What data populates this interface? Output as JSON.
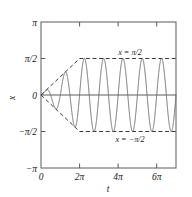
{
  "chart_data": {
    "type": "line",
    "title": "",
    "subtitle": "",
    "xlabel": "t",
    "ylabel": "x",
    "xlim": [
      0,
      21.9911485751
    ],
    "ylim": [
      -3.1415926536,
      3.1415926536
    ],
    "grid": false,
    "legend_position": "none",
    "xticks": [
      0,
      6.2831853072,
      12.5663706144,
      18.8495559215
    ],
    "xticklabels": [
      "0",
      "2π",
      "4π",
      "6π"
    ],
    "yticks": [
      3.1415926536,
      1.5707963268,
      0,
      -1.5707963268,
      -3.1415926536
    ],
    "yticklabels": [
      "π",
      "π/2",
      "0",
      "−π/2",
      "−π"
    ],
    "annotations": [
      {
        "id": "upper-asymptote-label",
        "text": "x = π/2",
        "x": 12.2,
        "y": 1.85
      },
      {
        "id": "lower-asymptote-label",
        "text": "x = −π/2",
        "x": 12.2,
        "y": -2.0
      }
    ],
    "series": [
      {
        "name": "oscillation",
        "style": "solid",
        "color": "#6e6e6e",
        "description": "Amplitude grows linearly from 0 at t=0 to pi/2 at t=2pi then saturates; angular frequency 2 (period pi)",
        "amplitude_saturation": 1.5707963268,
        "ramp_end_t": 6.2831853072,
        "angular_frequency": 2
      },
      {
        "name": "upper-envelope",
        "style": "dashed",
        "color": "#3a3a3a",
        "description": "Line from (0,0) to (2pi, pi/2), then constant at pi/2 to t=7pi",
        "points": [
          [
            0,
            0
          ],
          [
            6.2831853072,
            1.5707963268
          ],
          [
            21.9911485751,
            1.5707963268
          ]
        ]
      },
      {
        "name": "lower-envelope",
        "style": "dashed",
        "color": "#3a3a3a",
        "description": "Line from (0,0) to (2pi, -pi/2), then constant at -pi/2 to t=7pi",
        "points": [
          [
            0,
            0
          ],
          [
            6.2831853072,
            -1.5707963268
          ],
          [
            21.9911485751,
            -1.5707963268
          ]
        ]
      },
      {
        "name": "zero-axis",
        "style": "solid",
        "color": "#4a4a4a",
        "description": "Horizontal reference line at x = 0",
        "points": [
          [
            0,
            0
          ],
          [
            21.9911485751,
            0
          ]
        ]
      }
    ]
  },
  "labels": {
    "xaxis": "t",
    "yaxis": "x",
    "ytick_pi": "π",
    "ytick_half_pi": "π/2",
    "ytick_zero": "0",
    "ytick_neg_half_pi": "−π/2",
    "ytick_neg_pi": "−π",
    "xtick_zero": "0",
    "xtick_2pi": "2π",
    "xtick_4pi": "4π",
    "xtick_6pi": "6π",
    "annotation_upper": "x = π/2",
    "annotation_lower": "x = −π/2"
  },
  "colors": {
    "curve": "#6e6e6e",
    "envelope": "#3a3a3a",
    "frame": "#5a5a5a",
    "text": "#1a1a1a",
    "background": "#ffffff"
  }
}
